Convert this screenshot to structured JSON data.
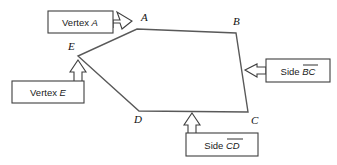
{
  "figure": {
    "background_color": "#ffffff",
    "line_color": "#595959",
    "box_stroke_color": "#3f3f3f",
    "text_color": "#1a1a1a"
  },
  "polygon": {
    "name": "pentagon-ABCDE",
    "vertices": [
      {
        "label": "A",
        "x": 137,
        "y": 29
      },
      {
        "label": "B",
        "x": 236,
        "y": 33
      },
      {
        "label": "C",
        "x": 248,
        "y": 112
      },
      {
        "label": "D",
        "x": 139,
        "y": 111
      },
      {
        "label": "E",
        "x": 78,
        "y": 56
      }
    ],
    "vertex_labels": [
      {
        "text": "A",
        "x": 141,
        "y": 21
      },
      {
        "text": "B",
        "x": 233,
        "y": 25
      },
      {
        "text": "C",
        "x": 251,
        "y": 124
      },
      {
        "text": "D",
        "x": 134,
        "y": 123
      },
      {
        "text": "E",
        "x": 68,
        "y": 50
      }
    ]
  },
  "callouts": [
    {
      "id": "vertex-a",
      "text_prefix": "Vertex ",
      "text_italic": "A",
      "box": {
        "x": 48,
        "y": 11,
        "w": 65,
        "h": 22
      },
      "text_x": 80,
      "text_y": 26,
      "arrow_direction": "up-right",
      "points_to": "A"
    },
    {
      "id": "vertex-e",
      "text_prefix": "Vertex ",
      "text_italic": "E",
      "box": {
        "x": 12,
        "y": 81,
        "w": 72,
        "h": 22
      },
      "text_x": 48,
      "text_y": 96,
      "arrow_direction": "up",
      "points_to": "E"
    },
    {
      "id": "side-bc",
      "text_prefix": "Side ",
      "text_italic": "BC",
      "overline": true,
      "box": {
        "x": 266,
        "y": 59,
        "w": 64,
        "h": 23
      },
      "text_x": 298,
      "text_y": 75,
      "arrow_direction": "left",
      "points_to": "BC"
    },
    {
      "id": "side-cd",
      "text_prefix": "Side ",
      "text_italic": "CD",
      "overline": true,
      "box": {
        "x": 186,
        "y": 133,
        "w": 72,
        "h": 23
      },
      "text_x": 222,
      "text_y": 149,
      "arrow_direction": "up",
      "points_to": "CD"
    }
  ]
}
